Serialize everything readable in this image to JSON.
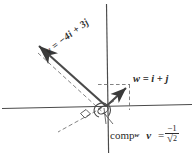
{
  "figure": {
    "background_color": "#ffffff",
    "ink_color": "#2b2b2b",
    "width": 194,
    "height": 157
  },
  "axes": {
    "origin": {
      "x": 107,
      "y": 107
    },
    "x_axis": {
      "x1": 2,
      "y1": 108,
      "x2": 192,
      "y2": 104
    },
    "y_axis": {
      "x1": 107,
      "y1": 4,
      "x2": 109,
      "y2": 153
    }
  },
  "labels": {
    "vector_v": {
      "text": "v = −4i + 3j",
      "v_symbol": "v",
      "equals": "=",
      "expression": "−4i + 3j"
    },
    "vector_w": {
      "text": "w = i + j",
      "w_symbol": "w",
      "equals": "=",
      "expression": "i + j"
    },
    "component": {
      "word": "comp",
      "subscript": "w",
      "vector": "v",
      "equals": "=",
      "numerator": "−1",
      "radical": "√",
      "radicand": "2",
      "full_text": "comp_w v = −1/√2"
    }
  },
  "vectors": [
    {
      "name": "v",
      "components": {
        "i": -4,
        "j": 3
      },
      "from": {
        "x": 107,
        "y": 107
      },
      "to": {
        "x": 33,
        "y": 41
      },
      "style": "solid-arrow"
    },
    {
      "name": "w",
      "components": {
        "i": 1,
        "j": 1
      },
      "from": {
        "x": 107,
        "y": 107
      },
      "to": {
        "x": 129,
        "y": 85
      },
      "style": "solid-arrow"
    }
  ],
  "construction": {
    "parallel_dashed_to_v": {
      "x1": 40,
      "y1": 55,
      "x2": 107,
      "y2": 117
    },
    "perpendicular_dashed": {
      "x1": 112,
      "y1": 102,
      "x2": 59,
      "y2": 131
    },
    "w_horizontal_dashed": {
      "x1": 99,
      "y1": 85,
      "x2": 129,
      "y2": 85
    },
    "w_vertical_dashed": {
      "x1": 129,
      "y1": 85,
      "x2": 129,
      "y2": 110
    },
    "right_angle_marker": {
      "x": 84,
      "y": 113,
      "size": 8
    },
    "angle_arc_at_origin": true,
    "leader_line": {
      "x1": 112,
      "y1": 122,
      "x2": 103,
      "y2": 113
    }
  },
  "icons": {
    "arrowhead": "arrow-head-icon",
    "right_angle": "right-angle-marker-icon",
    "angle_arc": "angle-arc-icon"
  }
}
